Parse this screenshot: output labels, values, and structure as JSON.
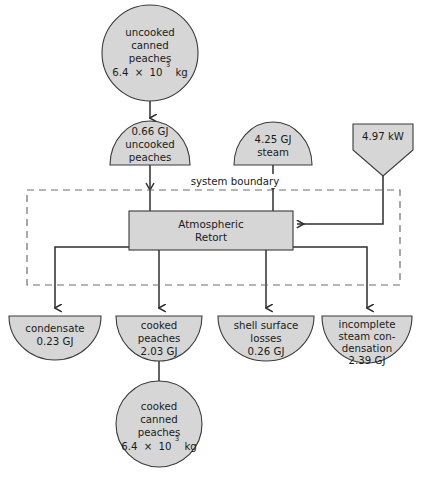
{
  "diagram": {
    "boundary_label": "system boundary",
    "colors": {
      "node_fill": "#d6d6d6",
      "node_stroke": "#3a3a3a",
      "flow_line": "#2e2e2e",
      "boundary_line": "#6e6e6e",
      "background": "#ffffff",
      "text": "#1a1a1a"
    },
    "process": {
      "name_line1": "Atmospheric",
      "name_line2": "Retort"
    },
    "inputs": [
      {
        "id": "uncooked-canned-peaches",
        "shape": "circle",
        "lines": [
          "uncooked",
          "canned",
          "peaches"
        ],
        "value_mantissa": "6.4",
        "value_times": "×",
        "value_base": "10",
        "value_exponent": "3",
        "value_unit": "kg",
        "value_full": "6.4 × 10³ kg"
      },
      {
        "id": "uncooked-peaches-energy",
        "shape": "semicircle-up",
        "lines": [
          "0.66 GJ",
          "uncooked",
          "peaches"
        ],
        "value": "0.66 GJ"
      },
      {
        "id": "steam",
        "shape": "semicircle-up",
        "lines": [
          "4.25 GJ",
          "steam"
        ],
        "value": "4.25 GJ"
      },
      {
        "id": "electric-power",
        "shape": "pentagon-down",
        "lines": [
          "4.97 kW"
        ],
        "value": "4.97 kW"
      }
    ],
    "outputs": [
      {
        "id": "condensate",
        "shape": "semicircle-down",
        "lines": [
          "condensate",
          "0.23 GJ"
        ],
        "value": "0.23 GJ"
      },
      {
        "id": "cooked-peaches",
        "shape": "semicircle-down",
        "lines": [
          "cooked",
          "peaches",
          "2.03 GJ"
        ],
        "value": "2.03 GJ"
      },
      {
        "id": "shell-surface-losses",
        "shape": "semicircle-down",
        "lines": [
          "shell surface",
          "losses",
          "0.26 GJ"
        ],
        "value": "0.26 GJ"
      },
      {
        "id": "incomplete-steam-condensation",
        "shape": "semicircle-down",
        "lines": [
          "incomplete",
          "steam con-",
          "densation",
          "2.39 GJ"
        ],
        "value": "2.39 GJ"
      },
      {
        "id": "cooked-canned-peaches",
        "shape": "circle",
        "lines": [
          "cooked",
          "canned",
          "peaches"
        ],
        "value_mantissa": "6.4",
        "value_times": "×",
        "value_base": "10",
        "value_exponent": "3",
        "value_unit": "kg",
        "value_full": "6.4 × 10³ kg"
      }
    ]
  }
}
